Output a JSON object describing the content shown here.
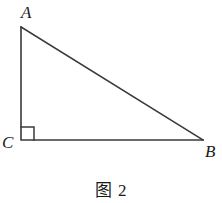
{
  "figure": {
    "caption": "图 2",
    "background_color": "#ffffff",
    "stroke_color": "#3a3a3a",
    "label_color": "#1a1a1a"
  },
  "diagram": {
    "type": "right-triangle",
    "vertices": [
      {
        "name": "A",
        "label": "A",
        "x": 21,
        "y": 27
      },
      {
        "name": "B",
        "label": "B",
        "x": 203,
        "y": 140
      },
      {
        "name": "C",
        "label": "C",
        "x": 21,
        "y": 140
      }
    ],
    "edges": [
      {
        "name": "side-AC",
        "from": "A",
        "to": "C"
      },
      {
        "name": "side-CB",
        "from": "C",
        "to": "B"
      },
      {
        "name": "side-AB",
        "from": "A",
        "to": "B"
      }
    ],
    "right_angle": {
      "at": "C",
      "marker": "square",
      "size": 13
    }
  }
}
